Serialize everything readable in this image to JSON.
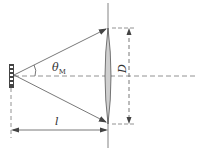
{
  "diagram": {
    "type": "optics-geometry",
    "labels": {
      "angle": "θ",
      "angle_subscript": "M",
      "diameter": "D",
      "distance": "l"
    },
    "colors": {
      "line": "#555555",
      "lens_fill": "#cfcfcf",
      "source": "#444444",
      "text": "#333333"
    }
  }
}
